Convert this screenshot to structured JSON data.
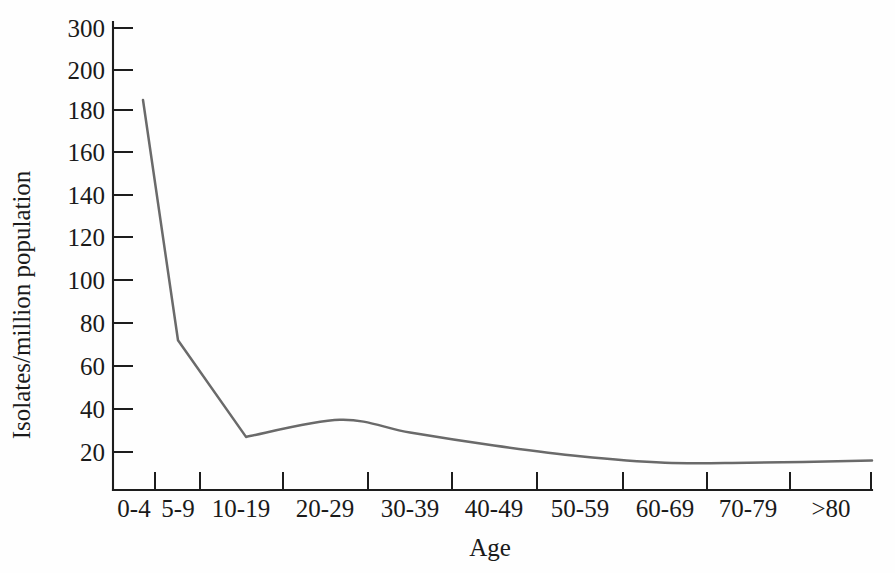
{
  "chart_data": {
    "type": "line",
    "title": "",
    "subtitle": "",
    "xlabel": "Age",
    "ylabel": "Isolates/million population",
    "categories": [
      "0-4",
      "5-9",
      "10-19",
      "20-29",
      "30-39",
      "40-49",
      "50-59",
      "60-69",
      "70-79",
      ">80"
    ],
    "values": [
      185,
      72,
      27,
      35,
      29,
      23,
      18,
      15,
      15,
      16
    ],
    "series": [
      {
        "name": "Isolates per million population by age group",
        "values": [
          185,
          72,
          27,
          35,
          29,
          23,
          18,
          15,
          15,
          16
        ]
      }
    ],
    "ytick_labels": [
      "300",
      "200",
      "180",
      "160",
      "140",
      "120",
      "100",
      "80",
      "60",
      "40",
      "20"
    ],
    "ytick_values": [
      300,
      200,
      180,
      160,
      140,
      120,
      100,
      80,
      60,
      40,
      20
    ],
    "y_axis_note": "non-linear / broken axis: 300 and 200 are compressed, below 200 ticks are linear in steps of 20",
    "ylim": [
      0,
      300
    ],
    "grid": false,
    "legend": false,
    "legend_position": "none",
    "line_color": "#6a6a6a",
    "axis_color": "#1d1d1d",
    "background_color": "#fefefe",
    "annotations": []
  },
  "axes": {
    "y_title": "Isolates/million population",
    "x_title": "Age"
  },
  "ticks": {
    "y": [
      {
        "label": "300",
        "value": 300
      },
      {
        "label": "200",
        "value": 200
      },
      {
        "label": "180",
        "value": 180
      },
      {
        "label": "160",
        "value": 160
      },
      {
        "label": "140",
        "value": 140
      },
      {
        "label": "120",
        "value": 120
      },
      {
        "label": "100",
        "value": 100
      },
      {
        "label": "80",
        "value": 80
      },
      {
        "label": "60",
        "value": 60
      },
      {
        "label": "40",
        "value": 40
      },
      {
        "label": "20",
        "value": 20
      }
    ],
    "x": [
      {
        "label": "0-4"
      },
      {
        "label": "5-9"
      },
      {
        "label": "10-19"
      },
      {
        "label": "20-29"
      },
      {
        "label": "30-39"
      },
      {
        "label": "40-49"
      },
      {
        "label": "50-59"
      },
      {
        "label": "60-69"
      },
      {
        "label": "70-79"
      },
      {
        "label": ">80"
      }
    ]
  }
}
